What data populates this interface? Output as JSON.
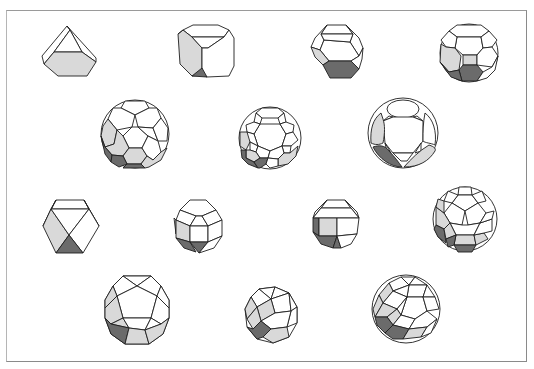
{
  "figure": {
    "colors": {
      "background": "#ffffff",
      "frame": "#8a8a8a",
      "edge": "#1e1e1e",
      "face_white": "#ffffff",
      "face_light": "#d9d9d9",
      "face_dark": "#6b6b6b"
    },
    "rows": [
      [
        "truncated tetrahedron",
        "truncated cube",
        "truncated octahedron",
        "truncated cuboctahedron"
      ],
      [
        "truncated icosahedron",
        "truncated icosidodecahedron",
        "truncated dodecahedron"
      ],
      [
        "cuboctahedron",
        "small rhombicuboctahedron",
        "rhombicuboctahedron",
        "small rhombicosidodecahedron"
      ],
      [
        "icosidodecahedron",
        "snub cube",
        "snub dodecahedron"
      ]
    ],
    "solids": [
      {
        "name": "truncated tetrahedron",
        "cx": 70,
        "cy": 52
      },
      {
        "name": "truncated cube",
        "cx": 205,
        "cy": 53
      },
      {
        "name": "truncated octahedron",
        "cx": 336,
        "cy": 52
      },
      {
        "name": "truncated cuboctahedron",
        "cx": 468,
        "cy": 53
      },
      {
        "name": "truncated icosahedron",
        "cx": 134,
        "cy": 133
      },
      {
        "name": "truncated icosidodecahedron",
        "cx": 270,
        "cy": 137
      },
      {
        "name": "truncated dodecahedron",
        "cx": 402,
        "cy": 132
      },
      {
        "name": "cuboctahedron",
        "cx": 70,
        "cy": 227
      },
      {
        "name": "small rhombicuboctahedron",
        "cx": 198,
        "cy": 225
      },
      {
        "name": "rhombicuboctahedron",
        "cx": 335,
        "cy": 225
      },
      {
        "name": "small rhombicosidodecahedron",
        "cx": 465,
        "cy": 218
      },
      {
        "name": "icosidodecahedron",
        "cx": 136,
        "cy": 310
      },
      {
        "name": "snub cube",
        "cx": 272,
        "cy": 315
      },
      {
        "name": "snub dodecahedron",
        "cx": 406,
        "cy": 308
      }
    ]
  }
}
